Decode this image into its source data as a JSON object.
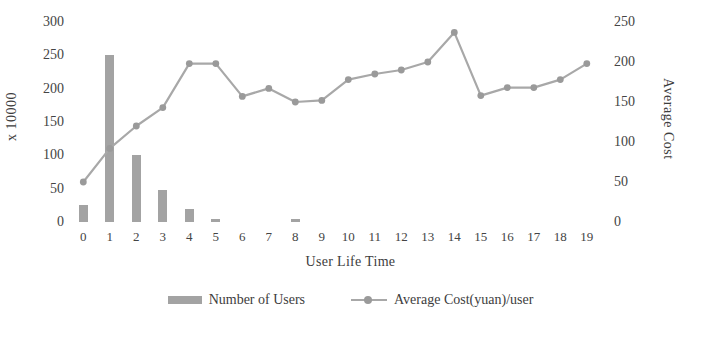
{
  "chart_data": {
    "type": "bar",
    "title": "",
    "subtitle": "",
    "xlabel": "User Life Time",
    "ylabel": "x 10000",
    "y2label": "Average Cost",
    "categories": [
      "0",
      "1",
      "2",
      "3",
      "4",
      "5",
      "6",
      "7",
      "8",
      "9",
      "10",
      "11",
      "12",
      "13",
      "14",
      "15",
      "16",
      "17",
      "18",
      "19"
    ],
    "ylim": [
      0,
      300
    ],
    "y2lim": [
      0,
      250
    ],
    "yticks": [
      0,
      50,
      100,
      150,
      200,
      250,
      300
    ],
    "y2ticks": [
      0,
      50,
      100,
      150,
      200,
      250
    ],
    "grid": false,
    "legend_position": "bottom",
    "series": [
      {
        "name": "Number of Users",
        "type": "bar",
        "axis": "left",
        "color": "#a3a3a3",
        "values": [
          25,
          250,
          100,
          48,
          20,
          4,
          0,
          0,
          4,
          0,
          0,
          0,
          0,
          0,
          0,
          0,
          0,
          0,
          0,
          0
        ]
      },
      {
        "name": "Average Cost(yuan)/user",
        "type": "line",
        "axis": "right",
        "color": "#a8a8a8",
        "marker": "circle",
        "values": [
          50,
          92,
          120,
          143,
          198,
          198,
          157,
          167,
          150,
          152,
          178,
          185,
          190,
          200,
          237,
          158,
          168,
          168,
          178,
          198
        ]
      }
    ]
  },
  "axes": {
    "left": {
      "title": "x 10000",
      "ticks": [
        "0",
        "50",
        "100",
        "150",
        "200",
        "250",
        "300"
      ]
    },
    "right": {
      "title": "Average Cost",
      "ticks": [
        "0",
        "50",
        "100",
        "150",
        "200",
        "250"
      ]
    },
    "bottom": {
      "title": "User Life Time",
      "ticks": [
        "0",
        "1",
        "2",
        "3",
        "4",
        "5",
        "6",
        "7",
        "8",
        "9",
        "10",
        "11",
        "12",
        "13",
        "14",
        "15",
        "16",
        "17",
        "18",
        "19"
      ]
    }
  },
  "legend": {
    "items": [
      {
        "label": "Number of Users",
        "marker": "bar-swatch-icon",
        "color": "#a3a3a3"
      },
      {
        "label": "Average Cost(yuan)/user",
        "marker": "line-marker-icon",
        "color": "#a8a8a8"
      }
    ]
  }
}
